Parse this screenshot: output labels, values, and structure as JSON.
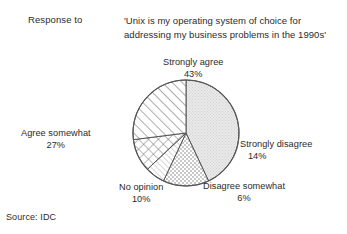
{
  "header": {
    "response_label": "Response to",
    "quote_line1": "'Unix is my operating system of choice for",
    "quote_line2": "addressing my business problems in the 1990s'"
  },
  "source": {
    "text": "Source: IDC"
  },
  "labels": {
    "strongly_agree": {
      "name": "Strongly agree",
      "pct": "43%"
    },
    "strongly_disagree": {
      "name": "Strongly disagree",
      "pct": "14%"
    },
    "disagree_somewhat": {
      "name": "Disagree somewhat",
      "pct": "6%"
    },
    "no_opinion": {
      "name": "No opinion",
      "pct": "10%"
    },
    "agree_somewhat": {
      "name": "Agree somewhat",
      "pct": "27%"
    }
  },
  "chart_data": {
    "type": "pie",
    "title": "'Unix is my operating system of choice for addressing my business problems in the 1990s'",
    "subtitle": "Response to",
    "source": "Source: IDC",
    "legend_position": "outside-labels",
    "grid": false,
    "start_angle": 0,
    "direction": "clockwise",
    "categories": [
      "Strongly agree",
      "Strongly disagree",
      "Disagree somewhat",
      "No opinion",
      "Agree somewhat"
    ],
    "values": [
      43,
      14,
      6,
      10,
      27
    ],
    "value_labels": [
      "43%",
      "14%",
      "6%",
      "10%",
      "27%"
    ],
    "units": "percent",
    "slices": [
      {
        "label": "Strongly agree",
        "value": 43,
        "value_label": "43%",
        "fill": "light-gray-stipple",
        "color": "#e3e3e3"
      },
      {
        "label": "Strongly disagree",
        "value": 14,
        "value_label": "14%",
        "fill": "fine-checkerboard",
        "color": "#ffffff"
      },
      {
        "label": "Disagree somewhat",
        "value": 6,
        "value_label": "6%",
        "fill": "fine-diagonal-lines",
        "color": "#ffffff"
      },
      {
        "label": "No opinion",
        "value": 10,
        "value_label": "10%",
        "fill": "cross-hatch-diamond",
        "color": "#ffffff"
      },
      {
        "label": "Agree somewhat",
        "value": 27,
        "value_label": "27%",
        "fill": "bold-diagonal-hatch",
        "color": "#ffffff"
      }
    ],
    "outline_color": "#555555",
    "background_color": "#ffffff"
  }
}
